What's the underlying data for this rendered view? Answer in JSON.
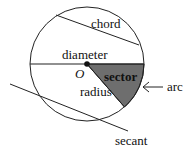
{
  "diagram": {
    "labels": {
      "chord": "chord",
      "diameter": "diameter",
      "center": "O",
      "sector": "sector",
      "radius": "radius",
      "arc": "arc",
      "secant": "secant"
    },
    "colors": {
      "stroke": "#222222",
      "sector_fill": "#6e6e6e",
      "background": "#ffffff"
    }
  }
}
